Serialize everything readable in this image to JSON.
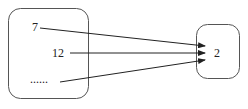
{
  "diagram": {
    "type": "mapping",
    "domain_set": {
      "elements": [
        "7",
        "12",
        "......"
      ]
    },
    "codomain_set": {
      "elements": [
        "2"
      ]
    },
    "arrows": [
      {
        "from": "7",
        "to": "2"
      },
      {
        "from": "12",
        "to": "2"
      },
      {
        "from": "......",
        "to": "2"
      }
    ],
    "colors": {
      "stroke": "#333333",
      "text": "#222222"
    }
  }
}
